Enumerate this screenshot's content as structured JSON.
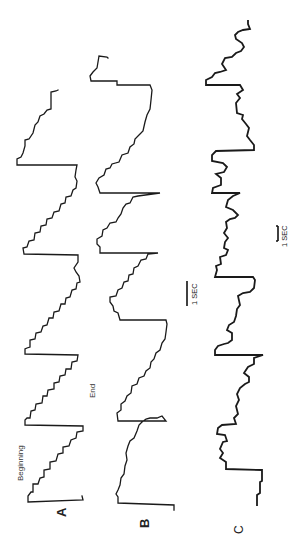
{
  "figure": {
    "panels": [
      {
        "id": "A",
        "label": "A",
        "annotations": [
          "Beginning",
          "End"
        ]
      },
      {
        "id": "B",
        "label": "B"
      },
      {
        "id": "C",
        "label": "C"
      }
    ],
    "scale_bars": [
      {
        "label": "1 SEC",
        "applies_to": "A and B"
      },
      {
        "label": "1 SEC",
        "applies_to": "C"
      }
    ],
    "line_color": "#1a1a1a",
    "background": "#ffffff"
  },
  "labels": {
    "panel_a": "A",
    "panel_b": "B",
    "panel_c": "C",
    "beginning": "Beginning",
    "end": "End",
    "scale_ab": "1 SEC",
    "scale_c": "1 SEC"
  }
}
